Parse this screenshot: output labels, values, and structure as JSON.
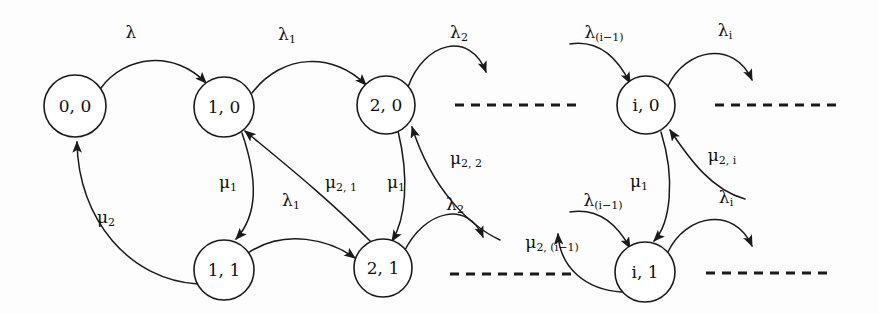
{
  "figure": {
    "kind": "state-transition-diagram",
    "title": "",
    "background_color": "#fdfdfd",
    "stroke_color": "#1a1a1a",
    "canvas": {
      "width": 879,
      "height": 314
    }
  },
  "nodes": [
    {
      "id": "s00",
      "label": "0, 0",
      "cx": 75,
      "cy": 106,
      "r": 31
    },
    {
      "id": "s10",
      "label": "1, 0",
      "cx": 224,
      "cy": 107,
      "r": 30
    },
    {
      "id": "s20",
      "label": "2, 0",
      "cx": 386,
      "cy": 105,
      "r": 29
    },
    {
      "id": "si0",
      "label": "i, 0",
      "cx": 646,
      "cy": 105,
      "r": 29
    },
    {
      "id": "s11",
      "label": "1, 1",
      "cx": 224,
      "cy": 270,
      "r": 30
    },
    {
      "id": "s21",
      "label": "2, 1",
      "cx": 383,
      "cy": 268,
      "r": 29
    },
    {
      "id": "si1",
      "label": "i, 1",
      "cx": 645,
      "cy": 272,
      "r": 30
    }
  ],
  "edges": [
    {
      "id": "e1",
      "from": "s00",
      "to": "s10",
      "d": "M 101 88 C 125 55 175 50 206 83",
      "label": "λ",
      "sub": "",
      "lx": 131,
      "ly": 33
    },
    {
      "id": "e2",
      "from": "s11",
      "to": "s00",
      "d": "M 198 284 C 130 280 78 220 77 142",
      "label": "μ",
      "sub": "2",
      "lx": 106,
      "ly": 218
    },
    {
      "id": "e3",
      "from": "s10",
      "to": "s11",
      "d": "M 242 133 C 258 180 258 215 236 239",
      "label": "μ",
      "sub": "1",
      "lx": 228,
      "ly": 183
    },
    {
      "id": "e4",
      "from": "s10",
      "to": "s20",
      "d": "M 252 93 C 282 53 334 52 366 85",
      "label": "λ",
      "sub": "1",
      "lx": 287,
      "ly": 35
    },
    {
      "id": "e5",
      "from": "s11",
      "to": "s21",
      "d": "M 248 253 C 285 228 330 240 355 258",
      "label": "λ",
      "sub": "1",
      "lx": 291,
      "ly": 201
    },
    {
      "id": "e6",
      "from": "s21",
      "to": "s10",
      "d": "M 372 243 C 330 200 280 160 245 131",
      "label": "μ",
      "sub": "2, 1",
      "lx": 341,
      "ly": 183
    },
    {
      "id": "e7",
      "from": "s20",
      "to": "s21",
      "d": "M 398 131 C 410 180 405 220 392 241",
      "label": "μ",
      "sub": "1",
      "lx": 396,
      "ly": 183
    },
    {
      "id": "e8",
      "from": "s20",
      "to": "right-void",
      "d": "M 408 87 C 424 42 470 30 486 72",
      "label": "λ",
      "sub": "2",
      "lx": 459,
      "ly": 33
    },
    {
      "id": "e9",
      "from": "right-void",
      "to": "s20",
      "d": "M 500 240 C 470 226 432 190 412 127",
      "label": "μ",
      "sub": "2, 2",
      "lx": 466,
      "ly": 159
    },
    {
      "id": "e10",
      "from": "s21",
      "to": "right-void2",
      "d": "M 404 252 C 424 210 468 200 483 237",
      "label": "λ",
      "sub": "2",
      "lx": 455,
      "ly": 205
    },
    {
      "id": "e11",
      "from": "left-void",
      "to": "si0",
      "d": "M 570 44 C 596 40 616 55 630 83",
      "label": "λ",
      "sub": "(i−1)",
      "lx": 604,
      "ly": 33
    },
    {
      "id": "e12",
      "from": "si0",
      "to": "right-void3",
      "d": "M 668 86 C 686 48 734 40 752 80",
      "label": "λ",
      "sub": "i",
      "lx": 725,
      "ly": 31
    },
    {
      "id": "e13",
      "from": "si0",
      "to": "si1",
      "d": "M 661 132 C 676 180 670 224 654 241",
      "label": "μ",
      "sub": "1",
      "lx": 639,
      "ly": 182
    },
    {
      "id": "e14",
      "from": "right-void4",
      "to": "si0",
      "d": "M 745 199 C 712 190 690 160 670 130",
      "label": "μ",
      "sub": "2, i",
      "lx": 722,
      "ly": 156
    },
    {
      "id": "e15",
      "from": "left-void2",
      "to": "si1",
      "d": "M 570 212 C 596 208 616 222 630 248",
      "label": "λ",
      "sub": "(i−1)",
      "lx": 603,
      "ly": 201
    },
    {
      "id": "e16",
      "from": "si1",
      "to": "right-void5",
      "d": "M 668 252 C 686 214 734 206 752 246",
      "label": "λ",
      "sub": "i",
      "lx": 726,
      "ly": 198
    },
    {
      "id": "e17",
      "from": "si1",
      "to": "left-void3",
      "d": "M 622 292 C 586 290 560 268 558 234",
      "label": "μ",
      "sub": "2, (i−1)",
      "lx": 552,
      "ly": 243
    }
  ],
  "dashed_lines": [
    {
      "id": "d1",
      "x1": 455,
      "y1": 105,
      "x2": 582,
      "y2": 105
    },
    {
      "id": "d2",
      "x1": 715,
      "y1": 105,
      "x2": 842,
      "y2": 105
    },
    {
      "id": "d3",
      "x1": 450,
      "y1": 274,
      "x2": 578,
      "y2": 274
    },
    {
      "id": "d4",
      "x1": 706,
      "y1": 273,
      "x2": 832,
      "y2": 273
    }
  ],
  "chart_data": {
    "type": "diagram",
    "states": [
      "0, 0",
      "1, 0",
      "2, 0",
      "i, 0",
      "1, 1",
      "2, 1",
      "i, 1"
    ],
    "transitions": [
      {
        "from": "0, 0",
        "to": "1, 0",
        "rate": "λ"
      },
      {
        "from": "1, 0",
        "to": "2, 0",
        "rate": "λ₁"
      },
      {
        "from": "2, 0",
        "to": "…",
        "rate": "λ₂"
      },
      {
        "from": "…",
        "to": "i, 0",
        "rate": "λ₍ᵢ₋₁₎"
      },
      {
        "from": "i, 0",
        "to": "…",
        "rate": "λᵢ"
      },
      {
        "from": "1, 0",
        "to": "1, 1",
        "rate": "μ₁"
      },
      {
        "from": "2, 0",
        "to": "2, 1",
        "rate": "μ₁"
      },
      {
        "from": "i, 0",
        "to": "i, 1",
        "rate": "μ₁"
      },
      {
        "from": "1, 1",
        "to": "0, 0",
        "rate": "μ₂"
      },
      {
        "from": "1, 1",
        "to": "2, 1",
        "rate": "λ₁"
      },
      {
        "from": "2, 1",
        "to": "1, 0",
        "rate": "μ₂, ₁"
      },
      {
        "from": "2, 1",
        "to": "…",
        "rate": "λ₂"
      },
      {
        "from": "…",
        "to": "2, 0",
        "rate": "μ₂, ₂"
      },
      {
        "from": "…",
        "to": "i, 1",
        "rate": "λ₍ᵢ₋₁₎"
      },
      {
        "from": "i, 1",
        "to": "…",
        "rate": "λᵢ"
      },
      {
        "from": "…",
        "to": "i, 0",
        "rate": "μ₂, ᵢ"
      },
      {
        "from": "i, 1",
        "to": "…",
        "rate": "μ₂, ₍ᵢ₋₁₎"
      }
    ]
  }
}
